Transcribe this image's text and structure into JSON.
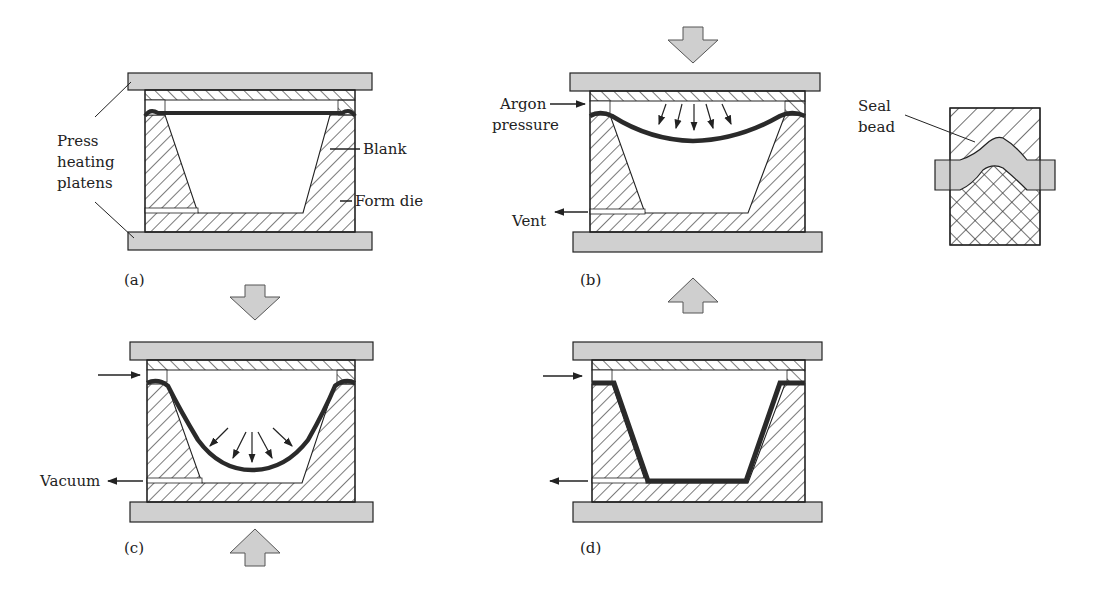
{
  "figure": {
    "colors": {
      "platen_fill": "#d0d0d0",
      "outline": "#222222",
      "blank": "#2a2a2a",
      "hatch": "#333333",
      "arrow_fill": "#cfcfcf"
    },
    "panels": {
      "a": {
        "label": "(a)",
        "annotations": {
          "press_heating_platens_1": "Press",
          "press_heating_platens_2": "heating",
          "press_heating_platens_3": "platens",
          "blank": "Blank",
          "form_die": "Form die"
        }
      },
      "b": {
        "label": "(b)",
        "annotations": {
          "argon_1": "Argon",
          "argon_2": "pressure",
          "vent": "Vent"
        }
      },
      "c": {
        "label": "(c)",
        "annotations": {
          "vacuum": "Vacuum"
        }
      },
      "d": {
        "label": "(d)"
      }
    },
    "seal_bead_detail": {
      "label_1": "Seal",
      "label_2": "bead"
    },
    "press_arrows": [
      {
        "id": "down-into-b",
        "direction": "down"
      },
      {
        "id": "down-a-to-c",
        "direction": "down"
      },
      {
        "id": "up-under-c",
        "direction": "up"
      },
      {
        "id": "up-d-to-b",
        "direction": "up"
      }
    ]
  }
}
